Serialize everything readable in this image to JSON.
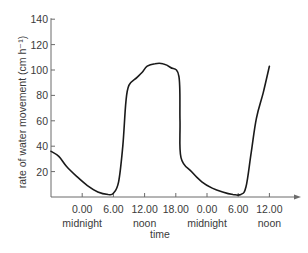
{
  "chart_data": {
    "type": "line",
    "title": "",
    "xlabel": "time",
    "ylabel": "rate of water movement (cm h⁻¹)",
    "ylim": [
      0,
      140
    ],
    "xlim_hours": [
      -6,
      40
    ],
    "grid": false,
    "legend": null,
    "y_ticks": [
      {
        "value": 140,
        "label": "140"
      },
      {
        "value": 120,
        "label": "120"
      },
      {
        "value": 100,
        "label": "100"
      },
      {
        "value": 80,
        "label": "80"
      },
      {
        "value": 60,
        "label": "60"
      },
      {
        "value": 40,
        "label": "40"
      },
      {
        "value": 20,
        "label": "20"
      }
    ],
    "x_ticks": [
      {
        "hour": 0,
        "label": "0.00",
        "sublabel": "midnight"
      },
      {
        "hour": 6,
        "label": "6.00",
        "sublabel": ""
      },
      {
        "hour": 12,
        "label": "12.00",
        "sublabel": "noon"
      },
      {
        "hour": 18,
        "label": "18.00",
        "sublabel": ""
      },
      {
        "hour": 24,
        "label": "0.00",
        "sublabel": "midnight"
      },
      {
        "hour": 30,
        "label": "6.00",
        "sublabel": ""
      },
      {
        "hour": 36,
        "label": "12.00",
        "sublabel": "noon"
      }
    ],
    "series": [
      {
        "name": "rate of water movement",
        "color": "#1a1a1a",
        "points": [
          {
            "x": -6,
            "y": 36
          },
          {
            "x": -4.5,
            "y": 32
          },
          {
            "x": -3,
            "y": 24
          },
          {
            "x": -1,
            "y": 16
          },
          {
            "x": 1,
            "y": 9
          },
          {
            "x": 3,
            "y": 4
          },
          {
            "x": 5,
            "y": 2
          },
          {
            "x": 6,
            "y": 3
          },
          {
            "x": 7,
            "y": 12
          },
          {
            "x": 7.8,
            "y": 40
          },
          {
            "x": 8.4,
            "y": 75
          },
          {
            "x": 9,
            "y": 88
          },
          {
            "x": 10.5,
            "y": 94
          },
          {
            "x": 11.5,
            "y": 98
          },
          {
            "x": 12.5,
            "y": 103
          },
          {
            "x": 14,
            "y": 105
          },
          {
            "x": 15.5,
            "y": 105
          },
          {
            "x": 17,
            "y": 102
          },
          {
            "x": 18.6,
            "y": 95
          },
          {
            "x": 18.8,
            "y": 60
          },
          {
            "x": 19,
            "y": 31
          },
          {
            "x": 21,
            "y": 20
          },
          {
            "x": 23,
            "y": 12
          },
          {
            "x": 25,
            "y": 7
          },
          {
            "x": 27,
            "y": 4
          },
          {
            "x": 29,
            "y": 2
          },
          {
            "x": 30.5,
            "y": 2
          },
          {
            "x": 31.5,
            "y": 8
          },
          {
            "x": 32.5,
            "y": 35
          },
          {
            "x": 33.5,
            "y": 62
          },
          {
            "x": 34.8,
            "y": 82
          },
          {
            "x": 36,
            "y": 103
          }
        ]
      }
    ]
  }
}
